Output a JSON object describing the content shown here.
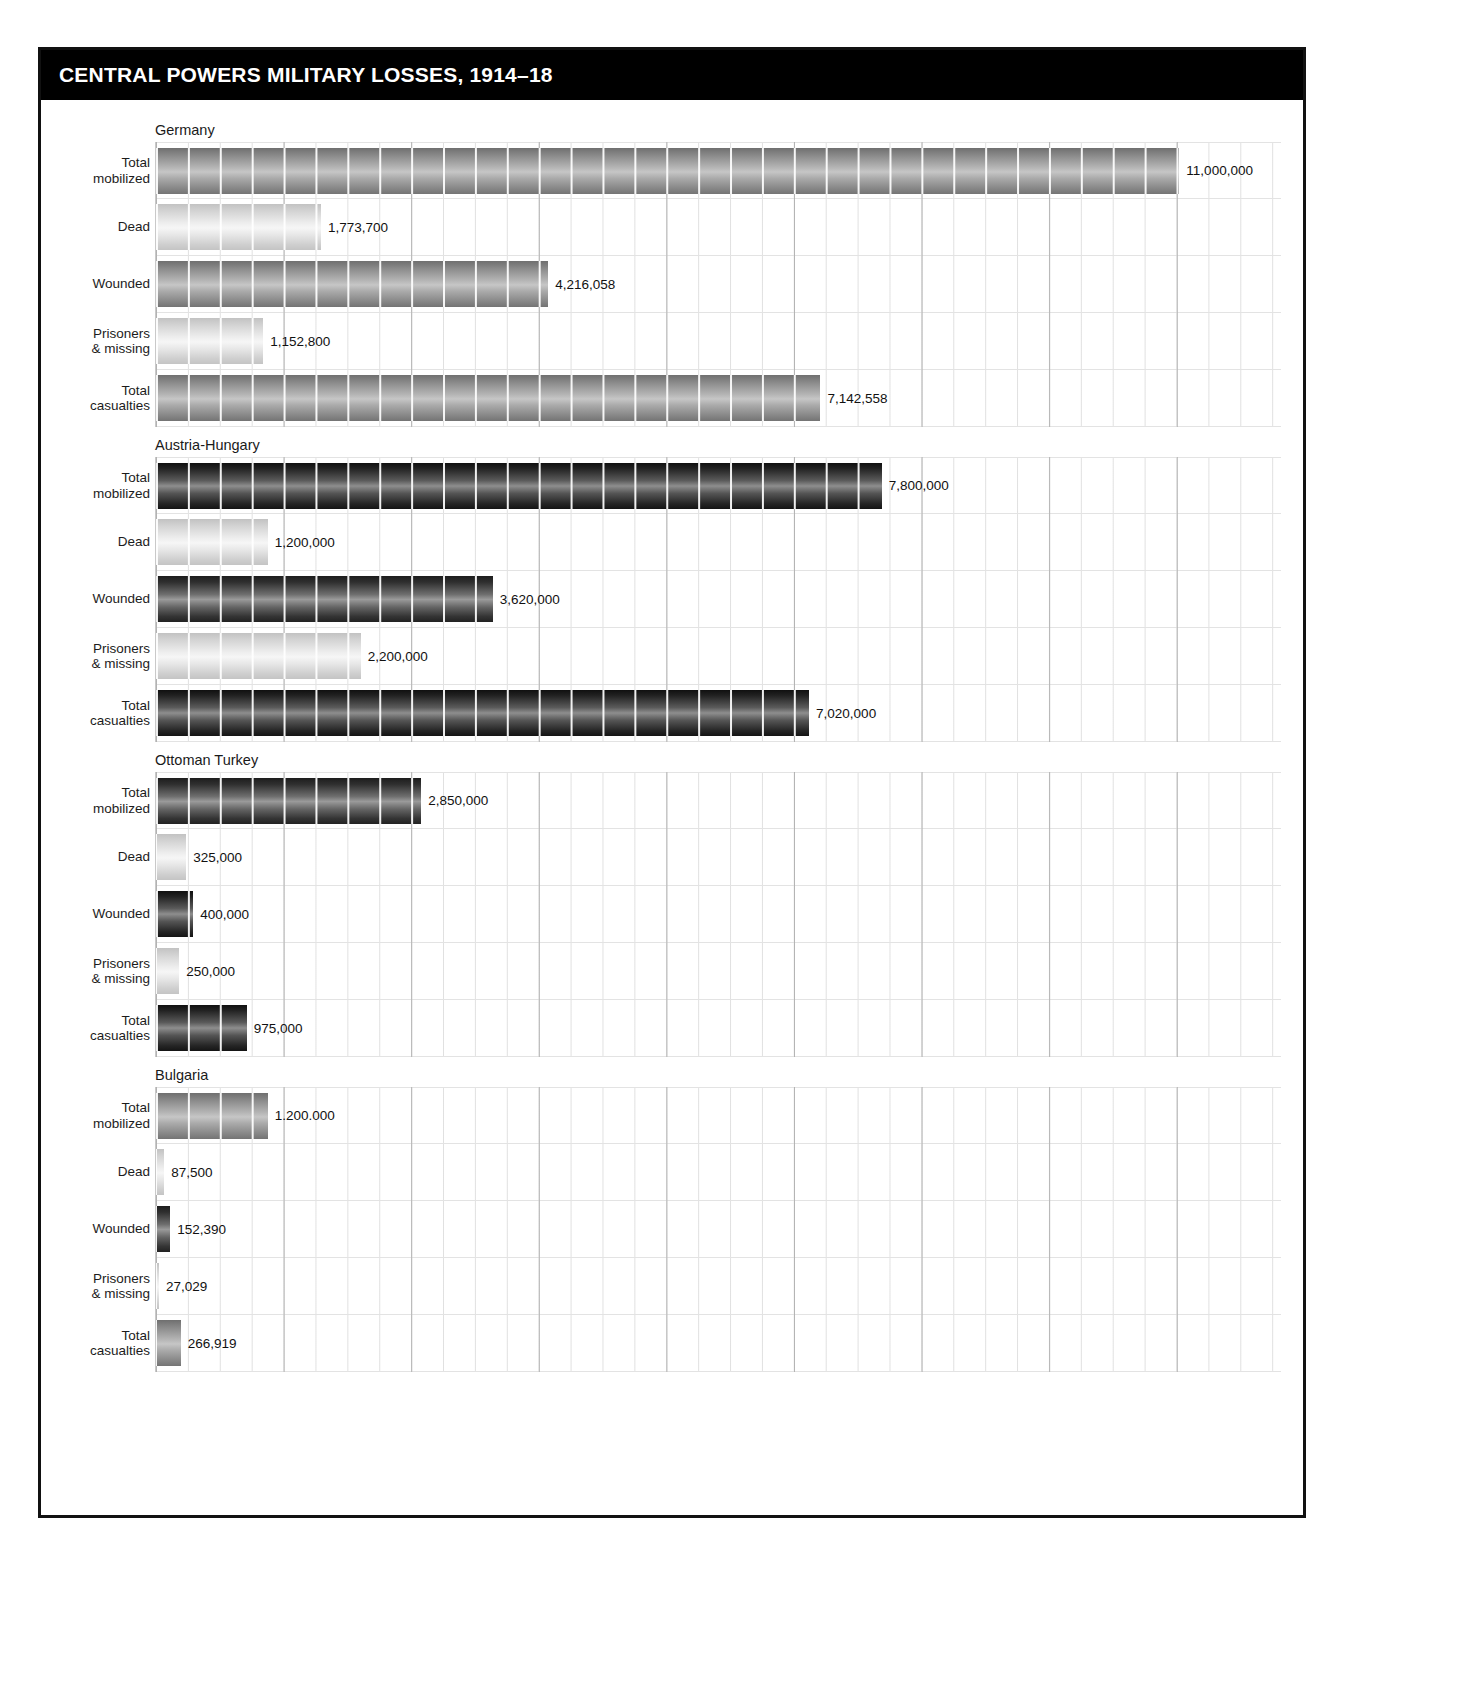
{
  "header": {
    "title": "CENTRAL POWERS MILITARY LOSSES, 1914–18"
  },
  "row_labels": {
    "total_mobilized_l1": "Total",
    "total_mobilized_l2": "mobilized",
    "dead": "Dead",
    "wounded": "Wounded",
    "prisoners_l1": "Prisoners",
    "prisoners_l2": "& missing",
    "total_casualties_l1": "Total",
    "total_casualties_l2": "casualties"
  },
  "panels": [
    {
      "name": "Germany",
      "rows": [
        {
          "label": "Total mobilized",
          "value_label": "11,000,000",
          "value": 11000000,
          "tone": "tone-mid"
        },
        {
          "label": "Dead",
          "value_label": "1,773,700",
          "value": 1773700,
          "tone": "tone-light"
        },
        {
          "label": "Wounded",
          "value_label": "4,216,058",
          "value": 4216058,
          "tone": "tone-mid"
        },
        {
          "label": "Prisoners & missing",
          "value_label": "1,152,800",
          "value": 1152800,
          "tone": "tone-light"
        },
        {
          "label": "Total casualties",
          "value_label": "7,142,558",
          "value": 7142558,
          "tone": "tone-mid"
        }
      ]
    },
    {
      "name": "Austria-Hungary",
      "rows": [
        {
          "label": "Total mobilized",
          "value_label": "7,800,000",
          "value": 7800000,
          "tone": "tone-deep"
        },
        {
          "label": "Dead",
          "value_label": "1,200,000",
          "value": 1200000,
          "tone": "tone-light"
        },
        {
          "label": "Wounded",
          "value_label": "3,620,000",
          "value": 3620000,
          "tone": "tone-dark"
        },
        {
          "label": "Prisoners & missing",
          "value_label": "2,200,000",
          "value": 2200000,
          "tone": "tone-light"
        },
        {
          "label": "Total casualties",
          "value_label": "7,020,000",
          "value": 7020000,
          "tone": "tone-deep"
        }
      ]
    },
    {
      "name": "Ottoman Turkey",
      "rows": [
        {
          "label": "Total mobilized",
          "value_label": "2,850,000",
          "value": 2850000,
          "tone": "tone-dark"
        },
        {
          "label": "Dead",
          "value_label": "325,000",
          "value": 325000,
          "tone": "tone-light"
        },
        {
          "label": "Wounded",
          "value_label": "400,000",
          "value": 400000,
          "tone": "tone-deep"
        },
        {
          "label": "Prisoners & missing",
          "value_label": "250,000",
          "value": 250000,
          "tone": "tone-light"
        },
        {
          "label": "Total casualties",
          "value_label": "975,000",
          "value": 975000,
          "tone": "tone-deep"
        }
      ]
    },
    {
      "name": "Bulgaria",
      "rows": [
        {
          "label": "Total mobilized",
          "value_label": "1.200.000",
          "value": 1200000,
          "tone": "tone-mid"
        },
        {
          "label": "Dead",
          "value_label": "87,500",
          "value": 87500,
          "tone": "tone-light"
        },
        {
          "label": "Wounded",
          "value_label": "152,390",
          "value": 152390,
          "tone": "tone-dark"
        },
        {
          "label": "Prisoners & missing",
          "value_label": "27,029",
          "value": 27029,
          "tone": "tone-light"
        },
        {
          "label": "Total casualties",
          "value_label": "266,919",
          "value": 266919,
          "tone": "tone-mid"
        }
      ]
    }
  ],
  "chart_data": {
    "type": "bar",
    "title": "CENTRAL POWERS MILITARY LOSSES, 1914–18",
    "orientation": "horizontal",
    "xlabel": "",
    "ylabel": "",
    "grid": true,
    "legend": "none",
    "axis_max": 12200000,
    "categories": [
      "Total mobilized",
      "Dead",
      "Wounded",
      "Prisoners & missing",
      "Total casualties"
    ],
    "series": [
      {
        "name": "Germany",
        "values": [
          11000000,
          1773700,
          4216058,
          1152800,
          7142558
        ]
      },
      {
        "name": "Austria-Hungary",
        "values": [
          7800000,
          1200000,
          3620000,
          2200000,
          7020000
        ]
      },
      {
        "name": "Ottoman Turkey",
        "values": [
          2850000,
          325000,
          400000,
          250000,
          975000
        ]
      },
      {
        "name": "Bulgaria",
        "values": [
          1200000,
          87500,
          152390,
          27029,
          266919
        ]
      }
    ],
    "data_labels": [
      [
        "11,000,000",
        "1,773,700",
        "4,216,058",
        "1,152,800",
        "7,142,558"
      ],
      [
        "7,800,000",
        "1,200,000",
        "3,620,000",
        "2,200,000",
        "7,020,000"
      ],
      [
        "2,850,000",
        "325,000",
        "400,000",
        "250,000",
        "975,000"
      ],
      [
        "1.200.000",
        "87,500",
        "152,390",
        "27,029",
        "266,919"
      ]
    ]
  },
  "colors": {
    "title_bar_bg": "#000000",
    "title_text": "#ffffff",
    "frame": "#111111",
    "page_bg": "#ffffff",
    "grid_major": "#aaaaaa",
    "grid_minor": "#c8c8c8",
    "label_text": "#1c1c1c"
  }
}
